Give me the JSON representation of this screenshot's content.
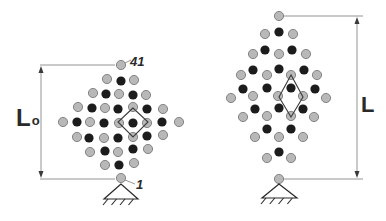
{
  "colors": {
    "node_gray": "#b8b8b8",
    "node_gray_stroke": "#6e6e6e",
    "node_black": "#1c1c1c",
    "line": "#7a7a7a",
    "text": "#2a2a2a"
  },
  "left_lattice": {
    "length_label": "L",
    "length_label_sub": "o",
    "top_node_label": "41",
    "bottom_node_label": "1",
    "gray_nodes": [
      [
        121,
        65
      ],
      [
        107,
        79
      ],
      [
        134,
        80
      ],
      [
        93,
        93
      ],
      [
        119,
        94
      ],
      [
        146,
        95
      ],
      [
        78,
        107
      ],
      [
        105,
        108
      ],
      [
        133,
        107
      ],
      [
        163,
        109
      ],
      [
        63,
        122
      ],
      [
        90,
        122
      ],
      [
        119,
        123
      ],
      [
        147,
        123
      ],
      [
        179,
        122
      ],
      [
        77,
        137
      ],
      [
        104,
        138
      ],
      [
        133,
        137
      ],
      [
        163,
        135
      ],
      [
        90,
        152
      ],
      [
        118,
        152
      ],
      [
        148,
        149
      ],
      [
        105,
        165
      ],
      [
        134,
        163
      ],
      [
        121,
        178
      ]
    ],
    "black_nodes": [
      [
        121,
        81
      ],
      [
        106,
        94
      ],
      [
        133,
        95
      ],
      [
        92,
        108
      ],
      [
        118,
        109
      ],
      [
        147,
        109
      ],
      [
        77,
        122
      ],
      [
        104,
        123
      ],
      [
        133,
        123
      ],
      [
        162,
        122
      ],
      [
        89,
        138
      ],
      [
        118,
        138
      ],
      [
        147,
        136
      ],
      [
        105,
        151
      ],
      [
        133,
        149
      ],
      [
        119,
        165
      ]
    ],
    "unit_cell": [
      [
        133,
        108
      ],
      [
        118,
        122
      ],
      [
        133,
        137
      ],
      [
        148,
        122
      ]
    ],
    "dim_top_y": 65,
    "dim_bottom_y": 179,
    "dim_x": 41,
    "support": {
      "apex": [
        121,
        184
      ],
      "base_left": [
        104,
        199
      ],
      "base_right": [
        138,
        199
      ]
    }
  },
  "right_lattice": {
    "length_label": "L",
    "gray_nodes": [
      [
        279,
        16
      ],
      [
        265,
        34
      ],
      [
        293,
        34
      ],
      [
        253,
        54
      ],
      [
        279,
        54
      ],
      [
        306,
        54
      ],
      [
        241,
        75
      ],
      [
        267,
        75
      ],
      [
        291,
        75
      ],
      [
        317,
        75
      ],
      [
        231,
        98
      ],
      [
        253,
        96
      ],
      [
        278,
        96
      ],
      [
        303,
        96
      ],
      [
        326,
        98
      ],
      [
        243,
        117
      ],
      [
        267,
        116
      ],
      [
        291,
        116
      ],
      [
        314,
        117
      ],
      [
        255,
        137
      ],
      [
        279,
        137
      ],
      [
        303,
        137
      ],
      [
        267,
        158
      ],
      [
        291,
        158
      ],
      [
        279,
        179
      ]
    ],
    "black_nodes": [
      [
        279,
        32
      ],
      [
        265,
        50
      ],
      [
        292,
        50
      ],
      [
        253,
        70
      ],
      [
        279,
        69
      ],
      [
        304,
        70
      ],
      [
        243,
        89
      ],
      [
        267,
        88
      ],
      [
        291,
        88
      ],
      [
        315,
        89
      ],
      [
        255,
        109
      ],
      [
        279,
        108
      ],
      [
        303,
        109
      ],
      [
        267,
        129
      ],
      [
        291,
        129
      ],
      [
        279,
        152
      ]
    ],
    "unit_cell": [
      [
        291,
        75
      ],
      [
        279,
        97
      ],
      [
        291,
        117
      ],
      [
        303,
        97
      ]
    ],
    "dim_top_y": 16,
    "dim_bottom_y": 179,
    "dim_x": 357,
    "support": {
      "apex": [
        279,
        184
      ],
      "base_left": [
        262,
        198
      ],
      "base_right": [
        297,
        198
      ]
    }
  }
}
